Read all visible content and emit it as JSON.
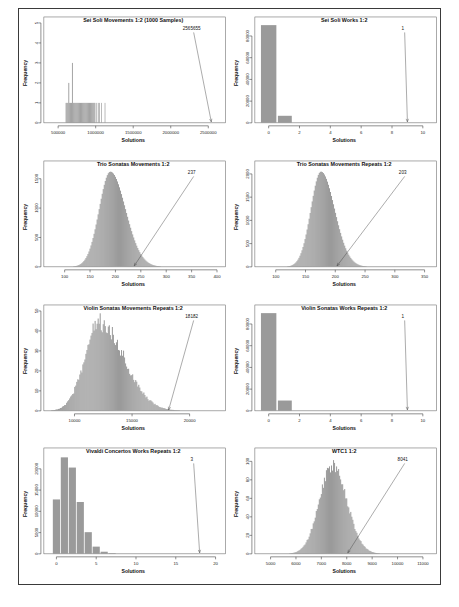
{
  "figure": {
    "panel_count": 8,
    "layout": "4 rows x 2 columns",
    "bar_color": "#9a9a9a",
    "frame_color": "#3a3a3a"
  },
  "chart_data": [
    {
      "type": "bar",
      "title": "Sei Soli Movements 1:2 (1000 Samples)",
      "xlabel": "Solutions",
      "ylabel": "Frequency",
      "xlim": [
        350000,
        2650000
      ],
      "ylim": [
        0,
        5
      ],
      "xticks": [
        "500000",
        "1000000",
        "1500000",
        "2000000",
        "2500000"
      ],
      "xtickvals": [
        500000,
        1000000,
        1500000,
        2000000,
        2500000
      ],
      "yticks": [
        "0",
        "1",
        "2",
        "3",
        "4",
        "5"
      ],
      "ytickvals": [
        0,
        1,
        2,
        3,
        4,
        5
      ],
      "annotation": "2565655",
      "annotation_x": 2540000,
      "annotation_y": 0,
      "grid": false,
      "distribution": "sparse-uniform-block",
      "bars": [
        {
          "x": 600000,
          "w": 12000,
          "h": 1
        },
        {
          "x": 612000,
          "w": 12000,
          "h": 1
        },
        {
          "x": 624000,
          "w": 12000,
          "h": 1
        },
        {
          "x": 636000,
          "w": 12000,
          "h": 2
        },
        {
          "x": 648000,
          "w": 12000,
          "h": 1
        },
        {
          "x": 660000,
          "w": 12000,
          "h": 1
        },
        {
          "x": 672000,
          "w": 12000,
          "h": 1
        },
        {
          "x": 684000,
          "w": 12000,
          "h": 3
        },
        {
          "x": 696000,
          "w": 12000,
          "h": 1
        },
        {
          "x": 708000,
          "w": 12000,
          "h": 1
        },
        {
          "x": 720000,
          "w": 12000,
          "h": 1
        },
        {
          "x": 732000,
          "w": 12000,
          "h": 1
        },
        {
          "x": 744000,
          "w": 12000,
          "h": 1
        },
        {
          "x": 756000,
          "w": 12000,
          "h": 1
        },
        {
          "x": 768000,
          "w": 12000,
          "h": 1
        },
        {
          "x": 780000,
          "w": 12000,
          "h": 1
        },
        {
          "x": 792000,
          "w": 12000,
          "h": 1
        },
        {
          "x": 804000,
          "w": 12000,
          "h": 1
        },
        {
          "x": 816000,
          "w": 12000,
          "h": 1
        },
        {
          "x": 828000,
          "w": 12000,
          "h": 1
        },
        {
          "x": 840000,
          "w": 12000,
          "h": 1
        },
        {
          "x": 852000,
          "w": 12000,
          "h": 1
        },
        {
          "x": 864000,
          "w": 12000,
          "h": 1
        },
        {
          "x": 876000,
          "w": 12000,
          "h": 1
        },
        {
          "x": 888000,
          "w": 12000,
          "h": 1
        },
        {
          "x": 900000,
          "w": 12000,
          "h": 1
        },
        {
          "x": 912000,
          "w": 12000,
          "h": 1
        },
        {
          "x": 924000,
          "w": 12000,
          "h": 1
        },
        {
          "x": 936000,
          "w": 12000,
          "h": 1
        },
        {
          "x": 948000,
          "w": 12000,
          "h": 1
        },
        {
          "x": 960000,
          "w": 12000,
          "h": 1
        },
        {
          "x": 972000,
          "w": 12000,
          "h": 1
        },
        {
          "x": 984000,
          "w": 12000,
          "h": 1
        },
        {
          "x": 1010000,
          "w": 9000,
          "h": 1
        },
        {
          "x": 1030000,
          "w": 9000,
          "h": 1
        },
        {
          "x": 1048000,
          "w": 9000,
          "h": 1
        },
        {
          "x": 1075000,
          "w": 9000,
          "h": 1
        },
        {
          "x": 1120000,
          "w": 9000,
          "h": 1
        }
      ]
    },
    {
      "type": "bar",
      "title": "Sei Soli Works 1:2",
      "xlabel": "Solutions",
      "ylabel": "Frequency",
      "xlim": [
        -0.7,
        10.5
      ],
      "ylim": [
        0,
        92000
      ],
      "xticks": [
        "0",
        "2",
        "4",
        "6",
        "8",
        "10"
      ],
      "xtickvals": [
        0,
        2,
        4,
        6,
        8,
        10
      ],
      "yticks": [
        "0",
        "20000",
        "40000",
        "60000",
        "80000"
      ],
      "ytickvals": [
        0,
        20000,
        40000,
        60000,
        80000
      ],
      "annotation": "1",
      "annotation_x": 9.0,
      "annotation_y": 0,
      "grid": false,
      "distribution": "two-bar",
      "bars": [
        {
          "x": -0.5,
          "w": 1.0,
          "h": 90000
        },
        {
          "x": 0.6,
          "w": 0.9,
          "h": 6500
        }
      ]
    },
    {
      "type": "bar",
      "title": "Trio Sonatas Movements 1:2",
      "xlabel": "Solutions",
      "ylabel": "Frequency",
      "xlim": [
        65,
        405
      ],
      "ylim": [
        0,
        1700
      ],
      "xticks": [
        "100",
        "150",
        "200",
        "250",
        "300",
        "350",
        "400"
      ],
      "xtickvals": [
        100,
        150,
        200,
        250,
        300,
        350,
        400
      ],
      "yticks": [
        "0",
        "500",
        "1000",
        "1500"
      ],
      "ytickvals": [
        0,
        500,
        1000,
        1500
      ],
      "annotation": "237",
      "annotation_x": 237,
      "annotation_y": 0,
      "grid": false,
      "distribution": "normal-skewed",
      "peak_x": 190,
      "peak_y": 1620,
      "sigma_left": 22,
      "sigma_right": 30
    },
    {
      "type": "bar",
      "title": "Trio Sonatas Movements Repeats 1:2",
      "xlabel": "Solutions",
      "ylabel": "Frequency",
      "xlim": [
        70,
        360
      ],
      "ylim": [
        0,
        2150
      ],
      "xticks": [
        "100",
        "150",
        "200",
        "250",
        "300",
        "350"
      ],
      "xtickvals": [
        100,
        150,
        200,
        250,
        300,
        350
      ],
      "yticks": [
        "0",
        "500",
        "1000",
        "1500",
        "2000"
      ],
      "ytickvals": [
        0,
        500,
        1000,
        1500,
        2000
      ],
      "annotation": "203",
      "annotation_x": 203,
      "annotation_y": 0,
      "grid": false,
      "distribution": "normal-skewed",
      "peak_x": 176,
      "peak_y": 2050,
      "sigma_left": 17,
      "sigma_right": 23
    },
    {
      "type": "bar",
      "title": "Violin Sonatas Movements Repeats 1:2",
      "xlabel": "Solutions",
      "ylabel": "Frequency",
      "xlim": [
        7600,
        22600
      ],
      "ylim": [
        0,
        50
      ],
      "xticks": [
        "10000",
        "15000",
        "20000"
      ],
      "xtickvals": [
        10000,
        15000,
        20000
      ],
      "yticks": [
        "0",
        "10",
        "20",
        "30",
        "40",
        "50"
      ],
      "ytickvals": [
        0,
        10,
        20,
        30,
        40,
        50
      ],
      "annotation": "18182",
      "annotation_x": 18182,
      "annotation_y": 0,
      "grid": false,
      "distribution": "noisy-normal-rightskew",
      "peak_x": 12200,
      "peak_y": 44,
      "sigma_left": 1300,
      "sigma_right": 2100,
      "noise": 0.22
    },
    {
      "type": "bar",
      "title": "Violin Sonatas Works Repeats 1:2",
      "xlabel": "Solutions",
      "ylabel": "Frequency",
      "xlim": [
        -0.7,
        10.5
      ],
      "ylim": [
        0,
        92000
      ],
      "xticks": [
        "0",
        "2",
        "4",
        "6",
        "8",
        "10"
      ],
      "xtickvals": [
        0,
        2,
        4,
        6,
        8,
        10
      ],
      "yticks": [
        "0",
        "20000",
        "40000",
        "60000",
        "80000"
      ],
      "ytickvals": [
        0,
        20000,
        40000,
        60000,
        80000
      ],
      "annotation": "1",
      "annotation_x": 9.0,
      "annotation_y": 0,
      "grid": false,
      "distribution": "two-bar",
      "bars": [
        {
          "x": -0.5,
          "w": 1.0,
          "h": 90000
        },
        {
          "x": 0.6,
          "w": 0.9,
          "h": 9500
        }
      ]
    },
    {
      "type": "bar",
      "title": "Vivaldi Concertos Works Repeats 1:2",
      "xlabel": "Solutions",
      "ylabel": "Frequency",
      "xlim": [
        -1.2,
        20.5
      ],
      "ylim": [
        0,
        23500
      ],
      "xticks": [
        "0",
        "5",
        "10",
        "15",
        "20"
      ],
      "xtickvals": [
        0,
        5,
        10,
        15,
        20
      ],
      "yticks": [
        "0",
        "5000",
        "10000",
        "15000",
        "20000"
      ],
      "ytickvals": [
        0,
        5000,
        10000,
        15000,
        20000
      ],
      "annotation": "3",
      "annotation_x": 18,
      "annotation_y": 0,
      "grid": false,
      "distribution": "discrete-bars",
      "bars": [
        {
          "x": -0.45,
          "w": 0.9,
          "h": 12800
        },
        {
          "x": 0.55,
          "w": 0.9,
          "h": 22700
        },
        {
          "x": 1.55,
          "w": 0.9,
          "h": 20300
        },
        {
          "x": 2.55,
          "w": 0.9,
          "h": 12200
        },
        {
          "x": 3.55,
          "w": 0.9,
          "h": 5100
        },
        {
          "x": 4.55,
          "w": 0.9,
          "h": 1700
        },
        {
          "x": 5.55,
          "w": 0.9,
          "h": 500
        },
        {
          "x": 6.55,
          "w": 0.9,
          "h": 150
        }
      ]
    },
    {
      "type": "bar",
      "title": "WTC1 1:2",
      "xlabel": "Solutions",
      "ylabel": "Frequency",
      "xlim": [
        4500,
        11300
      ],
      "ylim": [
        0,
        108
      ],
      "xticks": [
        "5000",
        "6000",
        "7000",
        "8000",
        "9000",
        "10000",
        "11000"
      ],
      "xtickvals": [
        5000,
        6000,
        7000,
        8000,
        9000,
        10000,
        11000
      ],
      "yticks": [
        "0",
        "20",
        "40",
        "60",
        "80",
        "100"
      ],
      "ytickvals": [
        0,
        20,
        40,
        60,
        80,
        100
      ],
      "annotation": "8041",
      "annotation_x": 8041,
      "annotation_y": 0,
      "grid": false,
      "distribution": "noisy-normal",
      "peak_x": 7450,
      "peak_y": 96,
      "sigma_left": 520,
      "sigma_right": 560,
      "noise": 0.14
    }
  ]
}
